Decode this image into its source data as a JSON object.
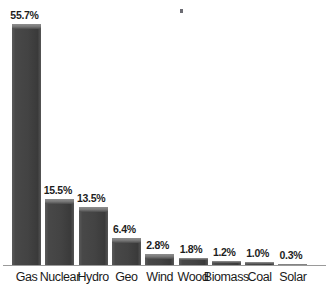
{
  "chart_data": {
    "type": "bar",
    "title": "",
    "subtitle": "",
    "xlabel": "",
    "ylabel": "",
    "ylim": [
      0,
      55.7
    ],
    "grid": false,
    "legend": "none",
    "orientation": "vertical",
    "value_suffix": "%",
    "categories": [
      "Gas",
      "Nuclear",
      "Hydro",
      "Geo",
      "Wind",
      "Wood",
      "Biomass",
      "Coal",
      "Solar"
    ],
    "values": [
      55.7,
      15.5,
      13.5,
      6.4,
      2.8,
      1.8,
      1.2,
      1.0,
      0.3
    ],
    "data_labels": [
      "55.7%",
      "15.5%",
      "13.5%",
      "6.4%",
      "2.8%",
      "1.8%",
      "1.2%",
      "1.0%",
      "0.3%"
    ],
    "bars": [
      {
        "category": "Gas",
        "value": 55.7,
        "label": "55.7%"
      },
      {
        "category": "Nuclear",
        "value": 15.5,
        "label": "15.5%"
      },
      {
        "category": "Hydro",
        "value": 13.5,
        "label": "13.5%"
      },
      {
        "category": "Geo",
        "value": 6.4,
        "label": "6.4%"
      },
      {
        "category": "Wind",
        "value": 2.8,
        "label": "2.8%"
      },
      {
        "category": "Wood",
        "value": 1.8,
        "label": "1.8%"
      },
      {
        "category": "Biomass",
        "value": 1.2,
        "label": "1.2%"
      },
      {
        "category": "Coal",
        "value": 1.0,
        "label": "1.0%"
      },
      {
        "category": "Solar",
        "value": 0.3,
        "label": "0.3%"
      }
    ]
  },
  "style": {
    "background": "#ffffff",
    "bar_fill": "#434343",
    "bar_highlight": "#8d8d8d",
    "axis_color": "#9a9a9a",
    "label_color": "#1a1a1a",
    "value_color": "#1d1d1d"
  }
}
